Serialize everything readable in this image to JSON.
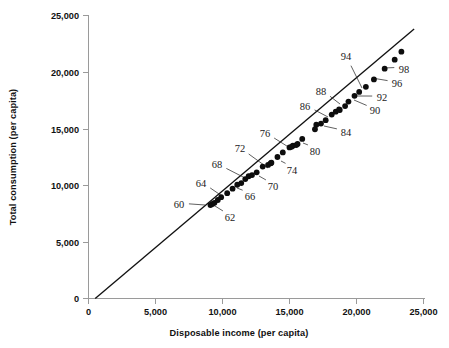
{
  "chart_data": {
    "type": "scatter",
    "title": "",
    "xlabel": "Disposable income (per capita)",
    "ylabel": "Total consumption (per capita)",
    "xlim": [
      0,
      25000
    ],
    "ylim": [
      0,
      25000
    ],
    "xticks": [
      0,
      5000,
      10000,
      15000,
      20000,
      25000
    ],
    "yticks": [
      0,
      5000,
      10000,
      15000,
      20000,
      25000
    ],
    "xtick_labels": [
      "0",
      "5,000",
      "10,000",
      "15,000",
      "20,000",
      "25,000"
    ],
    "ytick_labels": [
      "0",
      "5,000",
      "10,000",
      "15,000",
      "20,000",
      "25,000"
    ],
    "grid": false,
    "legend": false,
    "point_color": "#0d0d0d",
    "line_color": "#111111",
    "axis_color": "#9a9a9a",
    "fit_line": {
      "label": "45-degree reference line",
      "x0": 500,
      "y0": 0,
      "x1": 24300,
      "y1": 23800
    },
    "series": [
      {
        "name": "Disposable income vs Total consumption (per capita), 1959-1999",
        "points": [
          {
            "year": "59",
            "x": 9100,
            "y": 8250
          },
          {
            "year": "60",
            "x": 9250,
            "y": 8350
          },
          {
            "year": "61",
            "x": 9400,
            "y": 8450
          },
          {
            "year": "62",
            "x": 9650,
            "y": 8700
          },
          {
            "year": "63",
            "x": 9900,
            "y": 8950
          },
          {
            "year": "64",
            "x": 10350,
            "y": 9300
          },
          {
            "year": "65",
            "x": 10750,
            "y": 9700
          },
          {
            "year": "66",
            "x": 11100,
            "y": 10050
          },
          {
            "year": "67",
            "x": 11400,
            "y": 10200
          },
          {
            "year": "68",
            "x": 11700,
            "y": 10550
          },
          {
            "year": "69",
            "x": 11950,
            "y": 10800
          },
          {
            "year": "70",
            "x": 12200,
            "y": 10900
          },
          {
            "year": "71",
            "x": 12550,
            "y": 11150
          },
          {
            "year": "72",
            "x": 13000,
            "y": 11650
          },
          {
            "year": "73",
            "x": 13600,
            "y": 11950
          },
          {
            "year": "74",
            "x": 13400,
            "y": 11800
          },
          {
            "year": "75",
            "x": 13650,
            "y": 12000
          },
          {
            "year": "76",
            "x": 14100,
            "y": 12500
          },
          {
            "year": "77",
            "x": 14500,
            "y": 12900
          },
          {
            "year": "78",
            "x": 15000,
            "y": 13350
          },
          {
            "year": "79",
            "x": 15250,
            "y": 13500
          },
          {
            "year": "80",
            "x": 15150,
            "y": 13400
          },
          {
            "year": "81",
            "x": 15500,
            "y": 13550
          },
          {
            "year": "82",
            "x": 15600,
            "y": 13650
          },
          {
            "year": "83",
            "x": 15950,
            "y": 14100
          },
          {
            "year": "84",
            "x": 17000,
            "y": 15350
          },
          {
            "year": "85",
            "x": 16900,
            "y": 14950
          },
          {
            "year": "86",
            "x": 17350,
            "y": 15450
          },
          {
            "year": "87",
            "x": 17700,
            "y": 15750
          },
          {
            "year": "88",
            "x": 18150,
            "y": 16250
          },
          {
            "year": "89",
            "x": 18450,
            "y": 16500
          },
          {
            "year": "90",
            "x": 18700,
            "y": 16700
          },
          {
            "year": "91",
            "x": 18750,
            "y": 16650
          },
          {
            "year": "92",
            "x": 19150,
            "y": 17000
          },
          {
            "year": "93",
            "x": 19400,
            "y": 17400
          },
          {
            "year": "94",
            "x": 19850,
            "y": 17900
          },
          {
            "year": "95",
            "x": 20200,
            "y": 18250
          },
          {
            "year": "96",
            "x": 20700,
            "y": 18700
          },
          {
            "year": "97",
            "x": 21300,
            "y": 19350
          },
          {
            "year": "98",
            "x": 22100,
            "y": 20300
          },
          {
            "year": "99",
            "x": 22850,
            "y": 21100
          },
          {
            "year": "99b",
            "x": 23350,
            "y": 21800
          }
        ]
      }
    ],
    "annotations": [
      {
        "label": "60",
        "tx": 179,
        "ty": 208,
        "px": 205,
        "py": 205
      },
      {
        "label": "62",
        "tx": 230,
        "ty": 221,
        "px": 215,
        "py": 206
      },
      {
        "label": "64",
        "tx": 201,
        "ty": 187,
        "px": 222,
        "py": 196
      },
      {
        "label": "66",
        "tx": 250,
        "ty": 200,
        "px": 237,
        "py": 188
      },
      {
        "label": "68",
        "tx": 217,
        "ty": 168,
        "px": 247,
        "py": 179
      },
      {
        "label": "70",
        "tx": 273,
        "ty": 190,
        "px": 259,
        "py": 176
      },
      {
        "label": "72",
        "tx": 240,
        "ty": 152,
        "px": 268,
        "py": 168
      },
      {
        "label": "74",
        "tx": 292,
        "ty": 174,
        "px": 281,
        "py": 161
      },
      {
        "label": "76",
        "tx": 265,
        "ty": 137,
        "px": 290,
        "py": 148
      },
      {
        "label": "80",
        "tx": 315,
        "ty": 155,
        "px": 303,
        "py": 143
      },
      {
        "label": "84",
        "tx": 346,
        "ty": 136,
        "px": 324,
        "py": 126
      },
      {
        "label": "86",
        "tx": 305,
        "ty": 110,
        "px": 328,
        "py": 117
      },
      {
        "label": "88",
        "tx": 321,
        "ty": 95,
        "px": 340,
        "py": 104
      },
      {
        "label": "90",
        "tx": 375,
        "ty": 114,
        "px": 354,
        "py": 100
      },
      {
        "label": "92",
        "tx": 382,
        "ty": 101,
        "px": 357,
        "py": 96
      },
      {
        "label": "94",
        "tx": 346,
        "ty": 60,
        "px": 362,
        "py": 88
      },
      {
        "label": "96",
        "tx": 397,
        "ty": 87,
        "px": 372,
        "py": 78
      },
      {
        "label": "98",
        "tx": 404,
        "ty": 73,
        "px": 384,
        "py": 68
      }
    ]
  },
  "axes": {
    "y_title": "Total consumption (per capita)",
    "x_title": "Disposable income (per capita)",
    "x_labels": [
      "0",
      "5,000",
      "10,000",
      "15,000",
      "20,000",
      "25,000"
    ],
    "y_labels": [
      "25,000",
      "20,000",
      "15,000",
      "10,000",
      "5,000",
      "0"
    ]
  }
}
